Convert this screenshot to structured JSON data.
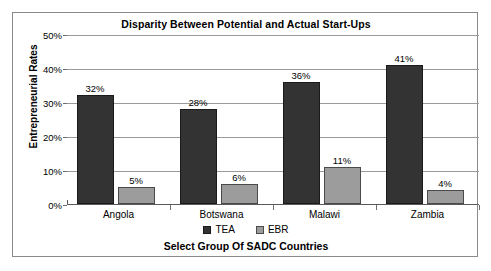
{
  "chart_data": {
    "type": "bar",
    "title": "Disparity Between Potential and Actual Start-Ups",
    "xlabel": "Select Group Of SADC Countries",
    "ylabel": "Entrepreneurial Rates",
    "categories": [
      "Angola",
      "Botswana",
      "Malawi",
      "Zambia"
    ],
    "series": [
      {
        "name": "TEA",
        "color": "#333333",
        "values": [
          32,
          28,
          36,
          41
        ],
        "labels": [
          "32%",
          "28%",
          "36%",
          "41%"
        ]
      },
      {
        "name": "EBR",
        "color": "#9c9c9c",
        "values": [
          5,
          6,
          11,
          4
        ],
        "labels": [
          "5%",
          "6%",
          "11%",
          "4%"
        ]
      }
    ],
    "ylim": [
      0,
      50
    ],
    "yticks": [
      0,
      10,
      20,
      30,
      40,
      50
    ],
    "ytick_labels": [
      "0%",
      "10%",
      "20%",
      "30%",
      "40%",
      "50%"
    ],
    "grid": true,
    "legend_position": "bottom",
    "value_labels": true
  }
}
